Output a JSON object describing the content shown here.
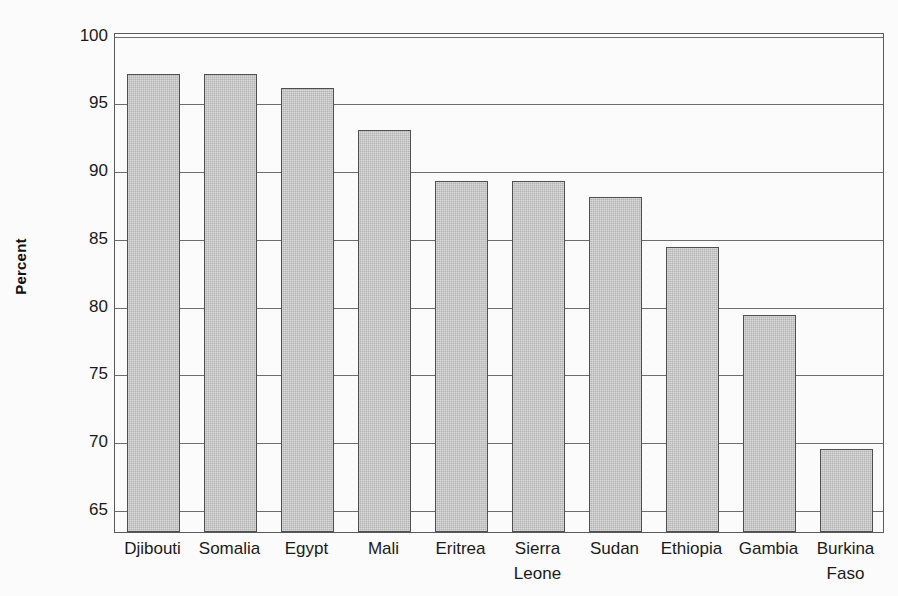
{
  "chart_data": {
    "type": "bar",
    "title": "",
    "subtitle": "",
    "xlabel": "",
    "ylabel": "Percent",
    "ylim": [
      63.3,
      100.2
    ],
    "yticks": [
      65,
      70,
      75,
      80,
      85,
      90,
      95,
      100
    ],
    "ytick_labels": [
      "65",
      "70",
      "75",
      "80",
      "85",
      "90",
      "95",
      "100"
    ],
    "grid": true,
    "grid_axis": "y",
    "legend": false,
    "legend_position": "none",
    "categories": [
      "Djibouti",
      "Somalia",
      "Egypt",
      "Mali",
      "Eritrea",
      "Sierra Leone",
      "Sudan",
      "Ethiopia",
      "Gambia",
      "Burkina Faso"
    ],
    "category_lines": [
      [
        "Djibouti"
      ],
      [
        "Somalia"
      ],
      [
        "Egypt"
      ],
      [
        "Mali"
      ],
      [
        "Eritrea"
      ],
      [
        "Sierra",
        "Leone"
      ],
      [
        "Sudan"
      ],
      [
        "Ethiopia"
      ],
      [
        "Gambia"
      ],
      [
        "Burkina",
        "Faso"
      ]
    ],
    "values": [
      97.1,
      97.1,
      96.1,
      93.0,
      89.2,
      89.2,
      88.0,
      84.3,
      79.3,
      69.4
    ],
    "bar_color": "#b4b4b4",
    "bar_edge_color": "#4f4f4f",
    "gridline_color": "#6d6d6d",
    "frame_color": "#5a5a5a",
    "background_color": "#fbfbfb",
    "text_color": "#1a1a1a"
  },
  "axes": {
    "y_title": "Percent"
  }
}
